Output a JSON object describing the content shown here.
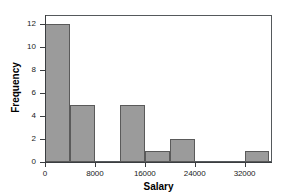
{
  "chart_data": {
    "type": "bar",
    "title": "",
    "xlabel": "Salary",
    "ylabel": "Frequency",
    "xlim": [
      0,
      36400
    ],
    "ylim": [
      0,
      12.8
    ],
    "grid": false,
    "legend": null,
    "bin_width": 4000,
    "bin_edges": [
      0,
      4000,
      8000,
      12000,
      16000,
      20000,
      24000,
      28000,
      32000,
      36000
    ],
    "categories": [
      "0-4000",
      "4000-8000",
      "8000-12000",
      "12000-16000",
      "16000-20000",
      "20000-24000",
      "24000-28000",
      "28000-32000",
      "32000-36000"
    ],
    "values": [
      12,
      5,
      0,
      5,
      1,
      2,
      0,
      0,
      1
    ],
    "bars": [
      {
        "start": 0,
        "end": 4000,
        "value": 12
      },
      {
        "start": 4000,
        "end": 8000,
        "value": 5
      },
      {
        "start": 8000,
        "end": 12000,
        "value": 0
      },
      {
        "start": 12000,
        "end": 16000,
        "value": 5
      },
      {
        "start": 16000,
        "end": 20000,
        "value": 1
      },
      {
        "start": 20000,
        "end": 24000,
        "value": 2
      },
      {
        "start": 24000,
        "end": 28000,
        "value": 0
      },
      {
        "start": 28000,
        "end": 32000,
        "value": 0
      },
      {
        "start": 32000,
        "end": 36000,
        "value": 1
      }
    ],
    "xticks": [
      0,
      8000,
      16000,
      24000,
      32000
    ],
    "xtick_labels": [
      "0",
      "8000",
      "16000",
      "24000",
      "32000"
    ],
    "yticks": [
      0,
      2,
      4,
      6,
      8,
      10,
      12
    ],
    "ytick_labels": [
      "0",
      "2",
      "4",
      "6",
      "8",
      "10",
      "12"
    ],
    "colors": {
      "bar_fill": "#9b9b9b",
      "bar_edge": "#5a5a5a",
      "axis": "#3a3d40",
      "frame": "#55595c",
      "text": "#1b1b1b",
      "background": "#ffffff"
    }
  }
}
